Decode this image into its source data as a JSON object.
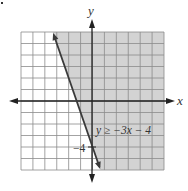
{
  "chart_data": {
    "type": "inequality-graph",
    "title": "",
    "xlabel": "x",
    "ylabel": "y",
    "xlim": [
      -6,
      6
    ],
    "ylim": [
      -6,
      6
    ],
    "grid": true,
    "grid_step": 1,
    "boundary": {
      "equation": "y = -3x - 4",
      "slope": -3,
      "intercept": -4,
      "style": "solid",
      "points": [
        [
          -3.33,
          6
        ],
        [
          0.67,
          -6
        ]
      ]
    },
    "inequality": "y ≥ −3x − 4",
    "shaded_region": "right of / above line",
    "annotations": [
      {
        "text": "y ≥ −3x − 4",
        "x": 0.6,
        "y": -2.5
      },
      {
        "text": "−4",
        "x": -0.9,
        "y": -4
      }
    ]
  },
  "labels": {
    "x_axis": "x",
    "y_axis": "y",
    "inequality": "y ≥ −3x − 4",
    "intercept": "−4"
  },
  "colors": {
    "shade": "#d3d3d3",
    "grid": "#8c8c8c",
    "axis": "#222222",
    "line": "#3a3a3a",
    "background": "#ffffff"
  }
}
